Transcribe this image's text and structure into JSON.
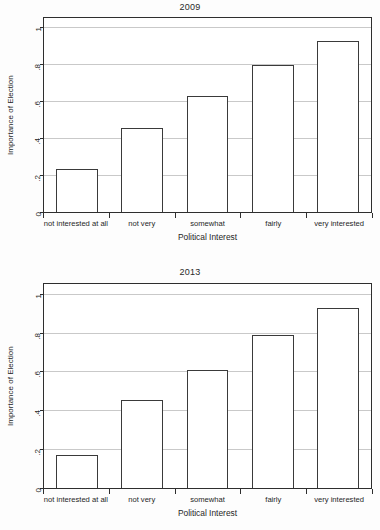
{
  "figure": {
    "background": "#fdfdfd",
    "bar_fill": "#ffffff",
    "bar_stroke": "#3a3a3a",
    "gridline_color": "#c9c9c9",
    "axis_color": "#2e2e2e"
  },
  "chart_data": [
    {
      "type": "bar",
      "title": "2009",
      "xlabel": "Political Interest",
      "ylabel": "Importance of Election",
      "categories": [
        "not interested at all",
        "not very",
        "somewhat",
        "fairly",
        "very interested"
      ],
      "values": [
        0.235,
        0.455,
        0.63,
        0.795,
        0.925
      ],
      "ylim": [
        0,
        1.05
      ],
      "yticks": [
        0,
        0.2,
        0.4,
        0.6,
        0.8,
        1
      ],
      "ytick_labels": [
        "0",
        ".2",
        ".4",
        ".6",
        ".8",
        "1"
      ],
      "grid": true,
      "legend": "none"
    },
    {
      "type": "bar",
      "title": "2013",
      "xlabel": "Political Interest",
      "ylabel": "Importance of Election",
      "categories": [
        "not interested at all",
        "not very",
        "somewhat",
        "fairly",
        "very interested"
      ],
      "values": [
        0.17,
        0.455,
        0.605,
        0.79,
        0.925
      ],
      "ylim": [
        0,
        1.05
      ],
      "yticks": [
        0,
        0.2,
        0.4,
        0.6,
        0.8,
        1
      ],
      "ytick_labels": [
        "0",
        ".2",
        ".4",
        ".6",
        ".8",
        "1"
      ],
      "grid": true,
      "legend": "none"
    }
  ]
}
